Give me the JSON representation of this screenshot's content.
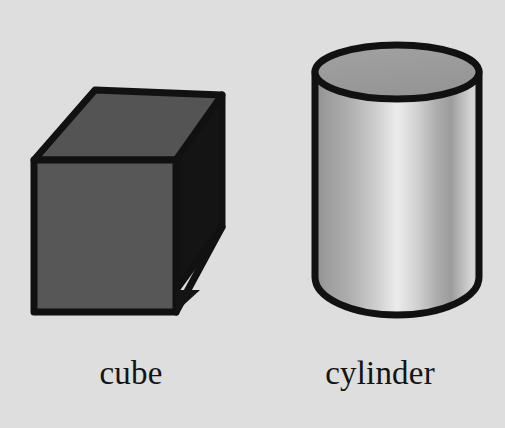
{
  "scene": {
    "title": "3D shapes illustration",
    "background_color": "#dedede",
    "width": 505,
    "height": 428
  },
  "shapes": [
    {
      "id": "cube",
      "label": "cube",
      "icon_name": "cube-shape",
      "outline_color": "#111111",
      "top_face_color": "#545454",
      "front_face_color": "#575757",
      "side_face_color": "#141414"
    },
    {
      "id": "cylinder",
      "label": "cylinder",
      "icon_name": "cylinder-shape",
      "outline_color": "#111111",
      "top_face_color": "#9a9a9a",
      "body_gradient": [
        "#8c8c8c",
        "#a8a8a8",
        "#ededed",
        "#b4b4b4",
        "#9a9a9a",
        "#d0d0d0"
      ]
    }
  ]
}
